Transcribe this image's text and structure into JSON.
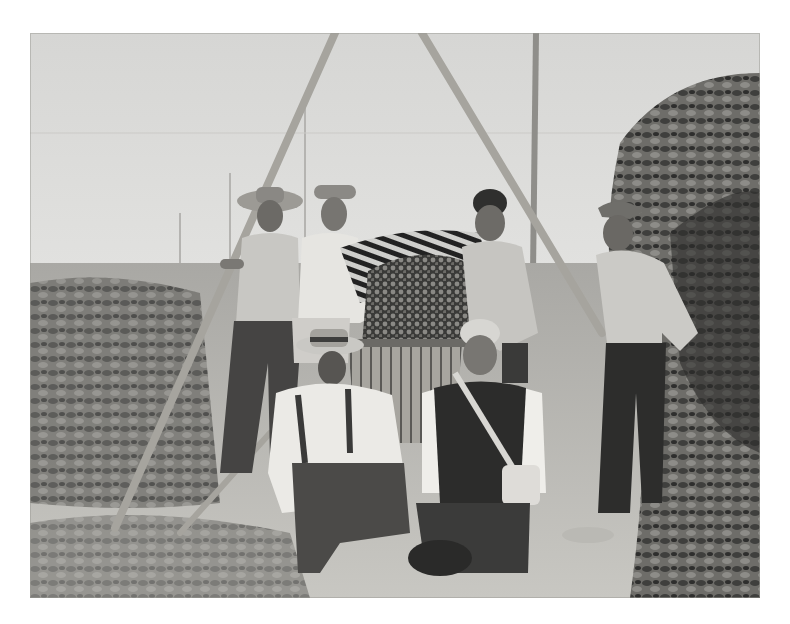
{
  "page": {
    "background": "#ffffff"
  },
  "photo": {
    "kind": "black-and-white historical photograph",
    "description": "Seven men posing in a hop field with a tripod of wooden poles; one pours harvested hops from a striped basket into a wooden slatted basket.",
    "tones": {
      "sky": "#dcdcda",
      "ground": "#bdbcb8",
      "foliage": "#4a4a48",
      "dark": "#2a2a2a",
      "light": "#efefed"
    },
    "subjects": [
      {
        "id": "man-1",
        "pose": "standing, holding pole",
        "attire": "brimmed hat, light shirt, dark trousers"
      },
      {
        "id": "man-2",
        "pose": "standing, pouring hops",
        "attire": "cap, white shirt"
      },
      {
        "id": "man-3",
        "pose": "standing, holding basket",
        "attire": "light shirt"
      },
      {
        "id": "man-4",
        "pose": "standing, hands on hips",
        "attire": "cap, light shirt, dark trousers"
      },
      {
        "id": "man-5",
        "pose": "crouching front left",
        "attire": "brimmed hat, white shirt, suspenders"
      },
      {
        "id": "man-6",
        "pose": "kneeling front center",
        "attire": "dark vest, white shirt, shoulder bag"
      }
    ],
    "objects": [
      "tripod poles",
      "striped hop basket",
      "wooden slatted basket",
      "hop vines",
      "dropped hat"
    ]
  }
}
